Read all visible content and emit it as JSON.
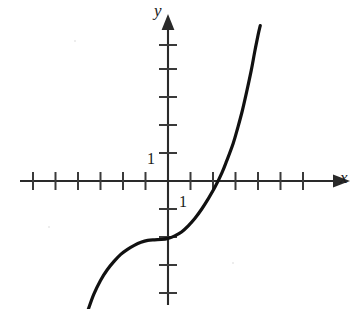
{
  "figure": {
    "background_color": "#ffffff",
    "ink_color": "#1a1a1a",
    "width": 359,
    "height": 309
  },
  "labels": {
    "y_axis": "y",
    "x_axis": "x",
    "y_unit_tick": "1",
    "x_unit_tick": "1"
  },
  "chart_data": {
    "type": "line",
    "title": "",
    "xlabel": "x",
    "ylabel": "y",
    "grid": false,
    "legend": null,
    "axis_style": "cartesian-arrows",
    "origin_px": [
      168,
      181
    ],
    "unit_px": {
      "x": 22.5,
      "y": 28.0
    },
    "xlim": [
      -6.6,
      8.5
    ],
    "ylim": [
      -4.6,
      6.3
    ],
    "xticks": [
      -6,
      -5,
      -4,
      -3,
      -2,
      -1,
      1,
      2,
      3,
      4,
      5,
      6
    ],
    "yticks": [
      -4,
      -3,
      -2,
      -1,
      1,
      2,
      3,
      4,
      5
    ],
    "xtick_labels": {
      "1": "1"
    },
    "ytick_labels": {
      "1": "1"
    },
    "annotations": [
      {
        "text": "1",
        "x": -0.85,
        "y": 1.0,
        "role": "y-unit-label"
      },
      {
        "text": "1",
        "x": 0.55,
        "y": -0.75,
        "role": "x-unit-label"
      }
    ],
    "series": [
      {
        "name": "cubic curve",
        "type": "line",
        "color": "#111111",
        "linewidth": 3.2,
        "description": "increasing cubic-like curve with flat inflection near x = -0.6, y-intercept near -2, x-intercept near 2.6",
        "points": [
          [
            -3.55,
            -4.6
          ],
          [
            -3.3,
            -4.05
          ],
          [
            -3.0,
            -3.55
          ],
          [
            -2.7,
            -3.17
          ],
          [
            -2.4,
            -2.87
          ],
          [
            -2.1,
            -2.62
          ],
          [
            -1.8,
            -2.44
          ],
          [
            -1.5,
            -2.3
          ],
          [
            -1.2,
            -2.19
          ],
          [
            -0.9,
            -2.12
          ],
          [
            -0.6,
            -2.1
          ],
          [
            -0.3,
            -2.09
          ],
          [
            0.0,
            -2.05
          ],
          [
            0.3,
            -1.96
          ],
          [
            0.6,
            -1.82
          ],
          [
            0.9,
            -1.6
          ],
          [
            1.2,
            -1.33
          ],
          [
            1.5,
            -1.0
          ],
          [
            1.8,
            -0.62
          ],
          [
            2.1,
            -0.2
          ],
          [
            2.4,
            0.3
          ],
          [
            2.6,
            0.7
          ],
          [
            2.9,
            1.35
          ],
          [
            3.1,
            1.9
          ],
          [
            3.3,
            2.5
          ],
          [
            3.5,
            3.2
          ],
          [
            3.7,
            3.95
          ],
          [
            3.85,
            4.6
          ],
          [
            4.0,
            5.2
          ],
          [
            4.1,
            5.55
          ]
        ]
      }
    ]
  }
}
